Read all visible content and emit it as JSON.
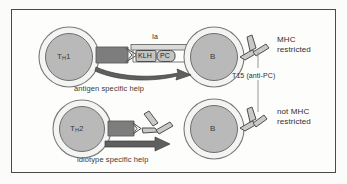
{
  "figure": {
    "title_present": false,
    "background": "#fbfbfa",
    "frame_color": "#4a4a4a"
  },
  "colors": {
    "cell_fill": "#b9b9b9",
    "cell_ring": "#f2f2f0",
    "cell_outline": "#6e6e6e",
    "receptor_dark": "#6f6f6f",
    "arrow_dark": "#5a5a5a",
    "antibody_fill": "#c9c9c9",
    "antibody_outline": "#4f4f4f",
    "box_fill": "#c4c4c4",
    "text": "#2b2b2b",
    "connector": "#8a8a8a"
  },
  "top_row": {
    "t_cell": {
      "name": "T",
      "subscript": "H",
      "number": "1",
      "full": "TH1"
    },
    "b_cell": {
      "label": "B"
    },
    "mhc_label": "Ia",
    "antigen_boxes": [
      {
        "label": "KLH"
      },
      {
        "label": "PC"
      }
    ],
    "help_arrow_label": "antigen specific help",
    "side_note": {
      "line1": "MHC",
      "line2": "restricted"
    }
  },
  "bottom_row": {
    "t_cell": {
      "name": "T",
      "subscript": "H",
      "number": "2",
      "full": "TH2"
    },
    "b_cell": {
      "label": "B"
    },
    "help_arrow_label": "idiotype specific help",
    "side_note": {
      "line1": "not MHC",
      "line2": "restricted"
    }
  },
  "connector": {
    "label": "T15 (anti-PC)"
  }
}
